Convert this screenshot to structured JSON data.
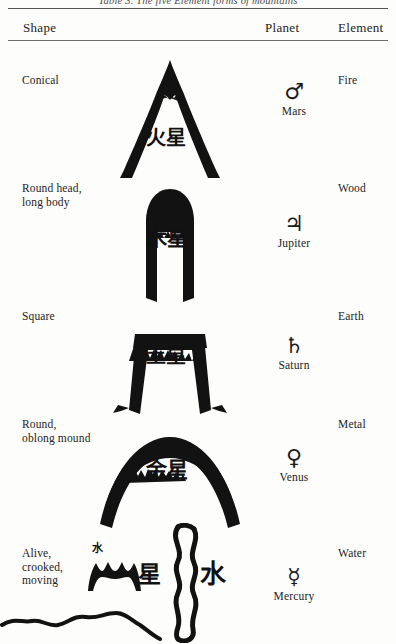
{
  "caption": "Table 3. The five Element forms of mountains",
  "table": {
    "headers": {
      "shape": "Shape",
      "planet": "Planet",
      "element": "Element"
    },
    "rows": [
      {
        "shape": "Conical",
        "mountain_label": "火星",
        "mountain_form": "sharp-peak-triangle",
        "planet_symbol": "♂",
        "planet_symbol_name": "mars-symbol",
        "planet": "Mars",
        "element": "Fire"
      },
      {
        "shape": "Round head,\nlong body",
        "mountain_label": "木星",
        "mountain_form": "rounded-top-column",
        "planet_symbol": "♃",
        "planet_symbol_name": "jupiter-symbol",
        "planet": "Jupiter",
        "element": "Wood"
      },
      {
        "shape": "Square",
        "mountain_label": "土星",
        "mountain_form": "flat-top-trapezoid",
        "planet_symbol": "♄",
        "planet_symbol_name": "saturn-symbol",
        "planet": "Saturn",
        "element": "Earth"
      },
      {
        "shape": "Round,\noblong mound",
        "mountain_label": "金星",
        "mountain_form": "broad-round-mound",
        "planet_symbol": "♀",
        "planet_symbol_name": "venus-symbol",
        "planet": "Venus",
        "element": "Metal"
      },
      {
        "shape": "Alive,\ncrooked,\nmoving",
        "mountain_label_small": "水",
        "mountain_label_left": "星",
        "mountain_label_right": "水",
        "mountain_form": "wavy-serpentine-ridge",
        "planet_symbol": "☿",
        "planet_symbol_name": "mercury-symbol",
        "planet": "Mercury",
        "element": "Water"
      }
    ]
  },
  "ink_color": "#111111",
  "rule_color": "#6c6a68"
}
